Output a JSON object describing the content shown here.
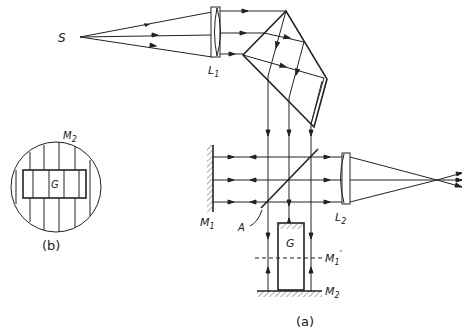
{
  "figure": {
    "panels": [
      {
        "id": "a",
        "caption": "(a)"
      },
      {
        "id": "b",
        "caption": "(b)"
      }
    ]
  },
  "labels": {
    "source": "S",
    "lens1": "L",
    "lens1_sub": "1",
    "lens2": "L",
    "lens2_sub": "2",
    "mirror1": "M",
    "mirror1_sub": "1",
    "mirror2": "M",
    "mirror2_sub": "2",
    "mirror1_image": "M",
    "mirror1_image_sub": "1",
    "mirror1_image_prime": "′",
    "beam_splitter": "A",
    "sample": "G",
    "inset_mirror": "M",
    "inset_mirror_sub": "2",
    "inset_sample": "G",
    "caption_a": "(a)",
    "caption_b": "(b)"
  },
  "colors": {
    "line": "#222222",
    "background": "#ffffff"
  }
}
